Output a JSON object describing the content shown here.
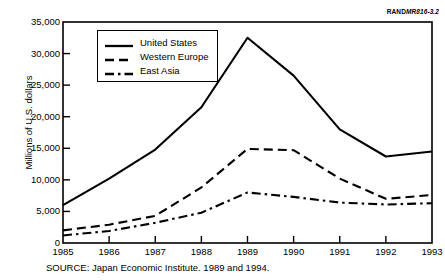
{
  "figure_id": {
    "prefix": "RAND",
    "suffix": "MR816-3.2"
  },
  "source_caption": "SOURCE: Japan Economic Institute. 1989 and 1994.",
  "legend": {
    "position": "inside-top-left",
    "entries": [
      {
        "label": "United States",
        "style": "solid",
        "color": "#000000"
      },
      {
        "label": "Western Europe",
        "style": "dashed",
        "color": "#000000"
      },
      {
        "label": "East Asia",
        "style": "dash-dot",
        "color": "#000000"
      }
    ]
  },
  "chart_data": {
    "type": "line",
    "title": "",
    "subtitle": "",
    "xlabel": "",
    "ylabel": "Millions of U.S. dollars",
    "x": [
      1985,
      1986,
      1987,
      1988,
      1989,
      1990,
      1991,
      1992,
      1993
    ],
    "categories": [
      "1985",
      "1986",
      "1987",
      "1988",
      "1989",
      "1990",
      "1991",
      "1992",
      "1993"
    ],
    "xlim": [
      1985,
      1993
    ],
    "ylim": [
      0,
      35000
    ],
    "ytick_values": [
      0,
      5000,
      10000,
      15000,
      20000,
      25000,
      30000,
      35000
    ],
    "ytick_labels": [
      "0",
      "5,000",
      "10,000",
      "15,000",
      "20,000",
      "25,000",
      "30,000",
      "35,000"
    ],
    "xtick_labels": [
      "1985",
      "1986",
      "1987",
      "1988",
      "1989",
      "1990",
      "1991",
      "1992",
      "1993"
    ],
    "grid": false,
    "legend_position": "inside-top-left",
    "series": [
      {
        "name": "United States",
        "style": "solid",
        "color": "#000000",
        "values": [
          6000,
          10200,
          14800,
          21500,
          32500,
          26500,
          18000,
          13700,
          14500
        ]
      },
      {
        "name": "Western Europe",
        "style": "dashed",
        "color": "#000000",
        "values": [
          2000,
          2900,
          4300,
          8800,
          14900,
          14700,
          10200,
          7000,
          7600
        ]
      },
      {
        "name": "East Asia",
        "style": "dash-dot",
        "color": "#000000",
        "values": [
          1200,
          1900,
          3200,
          4800,
          8000,
          7300,
          6400,
          6100,
          6300
        ]
      }
    ]
  }
}
